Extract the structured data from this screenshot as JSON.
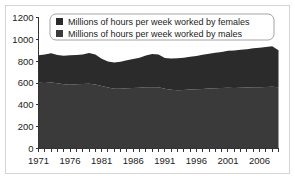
{
  "figure": {
    "background": "#ffffff",
    "frame_color": "#d4d4d4"
  },
  "chart_data": {
    "type": "area",
    "stacked": true,
    "title": "",
    "xlabel": "",
    "ylabel": "",
    "ylim": [
      0,
      1200
    ],
    "xlim": [
      1971,
      2009
    ],
    "yticks": [
      0,
      200,
      400,
      600,
      800,
      1000,
      1200
    ],
    "ytick_labels": [
      "0",
      "200",
      "400",
      "600",
      "800",
      "1000",
      "1200"
    ],
    "xticks": [
      1971,
      1976,
      1981,
      1986,
      1991,
      1996,
      2001,
      2006
    ],
    "xtick_labels": [
      "1971",
      "1976",
      "1981",
      "1986",
      "1991",
      "1996",
      "2001",
      "2006"
    ],
    "minor_xticks_every": 1,
    "grid": false,
    "legend_position": "upper-left",
    "x": [
      1971,
      1972,
      1973,
      1974,
      1975,
      1976,
      1977,
      1978,
      1979,
      1980,
      1981,
      1982,
      1983,
      1984,
      1985,
      1986,
      1987,
      1988,
      1989,
      1990,
      1991,
      1992,
      1993,
      1994,
      1995,
      1996,
      1997,
      1998,
      1999,
      2000,
      2001,
      2002,
      2003,
      2004,
      2005,
      2006,
      2007,
      2008,
      2009
    ],
    "series": [
      {
        "name": "Millions of hours per week worked by males",
        "color": "#3a3a3a",
        "values": [
          602,
          600,
          604,
          598,
          588,
          585,
          588,
          590,
          592,
          586,
          572,
          558,
          548,
          548,
          552,
          554,
          556,
          560,
          562,
          560,
          548,
          538,
          534,
          536,
          540,
          542,
          546,
          550,
          552,
          554,
          556,
          554,
          556,
          558,
          560,
          562,
          564,
          566,
          560
        ]
      },
      {
        "name": "Millions of hours per week worked by females",
        "color": "#2b2b2b",
        "values": [
          252,
          262,
          268,
          258,
          262,
          270,
          268,
          272,
          282,
          276,
          250,
          238,
          240,
          246,
          256,
          266,
          276,
          292,
          304,
          300,
          280,
          286,
          292,
          296,
          300,
          306,
          312,
          318,
          324,
          330,
          340,
          344,
          348,
          352,
          358,
          362,
          366,
          370,
          340
        ]
      }
    ],
    "totals": [
      854,
      862,
      872,
      856,
      850,
      855,
      856,
      862,
      874,
      862,
      822,
      796,
      788,
      794,
      808,
      820,
      832,
      852,
      866,
      860,
      828,
      824,
      826,
      832,
      840,
      848,
      858,
      868,
      876,
      884,
      896,
      898,
      904,
      910,
      918,
      924,
      930,
      936,
      900
    ]
  },
  "legend": {
    "items": [
      {
        "label": "Millions of hours per week worked by females",
        "swatch": "#2b2b2b"
      },
      {
        "label": "Millions of hours per week worked by males",
        "swatch": "#3a3a3a"
      }
    ]
  }
}
